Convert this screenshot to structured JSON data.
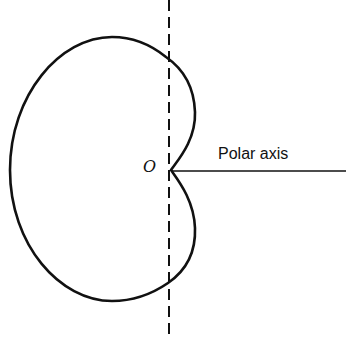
{
  "diagram": {
    "type": "polar-curve",
    "curve": "cardioid",
    "labels": {
      "origin": "O",
      "polar_axis": "Polar axis"
    },
    "colors": {
      "stroke": "#111111",
      "background": "#ffffff"
    }
  }
}
